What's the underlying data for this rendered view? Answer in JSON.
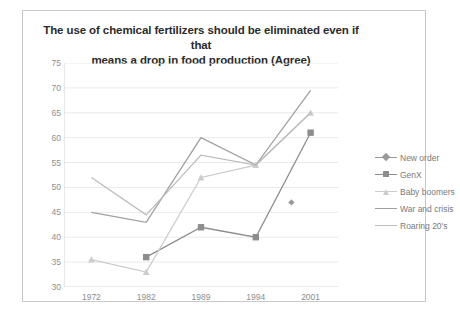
{
  "chart_data": {
    "type": "line",
    "title": "The use of chemical fertilizers should be eliminated even if that means a drop in food production (Agree)",
    "title_line1": "The use of chemical fertilizers should be eliminated even if that",
    "title_line2": "means a drop in food production (Agree)",
    "xlabel": "",
    "ylabel": "",
    "categories": [
      "1972",
      "1982",
      "1989",
      "1994",
      "2001"
    ],
    "ylim": [
      30,
      75
    ],
    "ytick_step": 5,
    "yticks": [
      "75",
      "70",
      "65",
      "60",
      "55",
      "50",
      "45",
      "40",
      "35",
      "30"
    ],
    "grid": true,
    "grid_axis": "y",
    "legend_position": "right",
    "series": [
      {
        "name": "New order",
        "color": "#9a9a9a",
        "marker": "diamond",
        "values": [
          null,
          null,
          null,
          null,
          null
        ],
        "extra_points": [
          {
            "x": "2001",
            "x_offset": -0.35,
            "y": 47
          }
        ]
      },
      {
        "name": "GenX",
        "color": "#8d8d8d",
        "marker": "square",
        "values": [
          null,
          36,
          42,
          40,
          61
        ]
      },
      {
        "name": "Baby boomers",
        "color": "#cccccc",
        "marker": "triangle",
        "values": [
          35.5,
          33,
          52,
          54.5,
          65
        ]
      },
      {
        "name": "War and crisis",
        "color": "#a0a0a0",
        "marker": "none",
        "values": [
          45,
          43,
          60,
          54.5,
          69.5
        ]
      },
      {
        "name": "Roaring 20's",
        "color": "#bdbdbd",
        "marker": "none",
        "values": [
          52,
          44.5,
          56.5,
          54.5,
          65
        ]
      }
    ]
  },
  "style": {
    "frame_border": "#c9c9c9",
    "grid_color": "#eaeaea",
    "axis_text": "#8e8e8e",
    "title_text": "#2b2b2b",
    "legend_text": "#7a7a7a",
    "background": "#ffffff"
  }
}
